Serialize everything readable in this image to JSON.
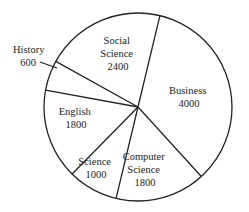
{
  "chart_data": {
    "type": "pie",
    "title": "",
    "categories": [
      "Social Science",
      "Business",
      "Computer Science",
      "Science",
      "English",
      "History"
    ],
    "values": [
      2400,
      4000,
      1800,
      1000,
      1800,
      600
    ],
    "total": 11600,
    "legend": "none (labels inside slices; History labeled outside with leader line)",
    "colors": {
      "fill": "#ffffff",
      "stroke": "#222222"
    }
  },
  "labels": [
    {
      "name": "Social",
      "line1": "Social",
      "line2": "Science",
      "value": "2400"
    },
    {
      "name": "Business",
      "line1": "Business",
      "value": "4000"
    },
    {
      "name": "Computer Science",
      "line1": "Computer",
      "line2": "Science",
      "value": "1800"
    },
    {
      "name": "Science",
      "line1": "Science",
      "value": "1000"
    },
    {
      "name": "English",
      "line1": "English",
      "value": "1800"
    },
    {
      "name": "History",
      "line1": "History",
      "value": "600"
    }
  ]
}
